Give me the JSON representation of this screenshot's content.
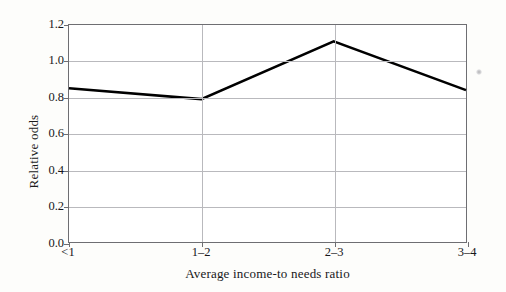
{
  "chart_data": {
    "type": "line",
    "title": "",
    "subtitle": "",
    "xlabel": "Average income-to needs ratio",
    "ylabel": "Relative odds",
    "categories": [
      "<1",
      "1–2",
      "2–3",
      "3–4"
    ],
    "values": [
      0.85,
      0.79,
      1.11,
      0.84
    ],
    "series": [
      {
        "name": "Relative odds",
        "values": [
          0.85,
          0.79,
          1.11,
          0.84
        ],
        "color": "#000000",
        "line_width": 2.6,
        "markers": false
      }
    ],
    "ylim": [
      0.0,
      1.2
    ],
    "yticks": [
      "0.0",
      "0.2",
      "0.4",
      "0.6",
      "0.8",
      "1.0",
      "1.2"
    ],
    "ytick_values": [
      0.0,
      0.2,
      0.4,
      0.6,
      0.8,
      1.0,
      1.2
    ],
    "xticks": [
      "<1",
      "1–2",
      "2–3",
      "3–4"
    ],
    "grid": {
      "horizontal": true,
      "vertical": true,
      "color": "#b9b9bd"
    },
    "legend": {
      "visible": false,
      "position": "none",
      "entries": []
    },
    "axes": {
      "frame_color": "#6e6e72",
      "background": "#ffffff"
    },
    "annotations": []
  },
  "figure": {
    "background": "#fdfdfb",
    "artifact_label": "scan-speck"
  }
}
